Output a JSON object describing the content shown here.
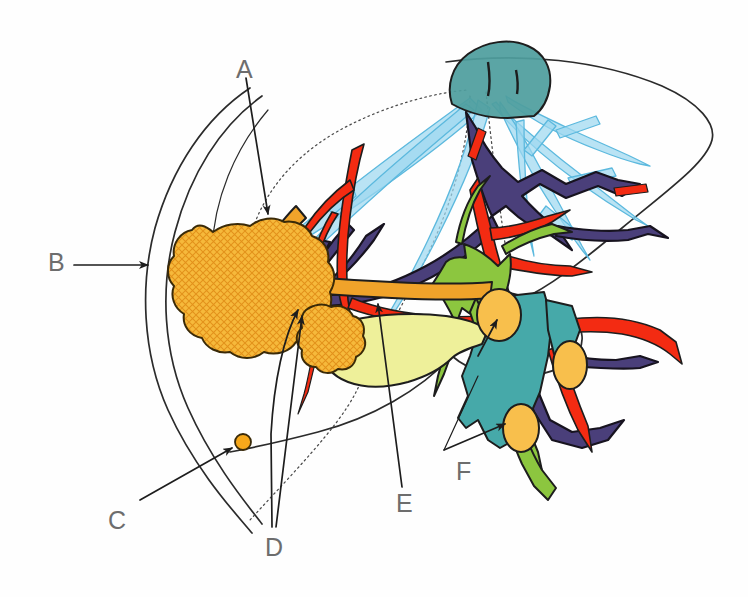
{
  "figure": {
    "background_color": "#ffffff",
    "width": 748,
    "height": 597
  },
  "palette": {
    "liver_outline": "#2b2b2b",
    "dotted_segment_line": "#555555",
    "hepatic_vein_blue": "#9ed8f0",
    "hepatic_vein_stroke": "#5bb8dd",
    "ivc_teal": "#4f9e9e",
    "duodenum_teal": "#46a9a9",
    "portal_vein_purple": "#4a3f7a",
    "hepatic_artery_red": "#f32b12",
    "bile_duct_green": "#8cc63f",
    "gallbladder_yellow": "#eef09a",
    "tumor_orange": "#f6b93b",
    "tumor_hatch": "#e8921c",
    "lymph_node_orange": "#f8bf4c",
    "label_gray": "#6d6d6d",
    "leader_line": "#2b2b2b"
  },
  "labels": [
    {
      "id": "A",
      "text": "A",
      "x": 236,
      "y": 57,
      "points_to": "cystic-duct-orange"
    },
    {
      "id": "B",
      "text": "B",
      "x": 48,
      "y": 250,
      "points_to": "large-tumor-mass"
    },
    {
      "id": "C",
      "text": "C",
      "x": 108,
      "y": 508,
      "points_to": "satellite-nodule"
    },
    {
      "id": "D",
      "text": "D",
      "x": 265,
      "y": 535,
      "points_to": "small-tumor-mass"
    },
    {
      "id": "E",
      "text": "E",
      "x": 396,
      "y": 495,
      "points_to": "common-bile-duct-orange"
    },
    {
      "id": "F",
      "text": "F",
      "x": 456,
      "y": 463,
      "points_to": "lymph-node-lower"
    }
  ],
  "structures": [
    {
      "name": "liver-outline",
      "label": "Liver capsule outline",
      "color": "#2b2b2b"
    },
    {
      "name": "inferior-vena-cava",
      "label": "Inferior vena cava",
      "color": "#4f9e9e"
    },
    {
      "name": "hepatic-veins",
      "label": "Hepatic veins",
      "color": "#9ed8f0"
    },
    {
      "name": "portal-vein-system",
      "label": "Portal vein branches",
      "color": "#4a3f7a"
    },
    {
      "name": "hepatic-artery-system",
      "label": "Hepatic artery branches",
      "color": "#f32b12"
    },
    {
      "name": "bile-duct-system",
      "label": "Intrahepatic bile ducts",
      "color": "#8cc63f"
    },
    {
      "name": "gallbladder",
      "label": "Gallbladder",
      "color": "#eef09a"
    },
    {
      "name": "large-tumor-mass",
      "label": "Large hatched tumor mass",
      "color": "#f6b93b"
    },
    {
      "name": "small-tumor-mass",
      "label": "Small hatched tumor mass",
      "color": "#f6b93b"
    },
    {
      "name": "satellite-nodule",
      "label": "Satellite nodule",
      "color": "#f6b93b"
    },
    {
      "name": "lymph-nodes",
      "label": "Lymph nodes",
      "color": "#f8bf4c"
    },
    {
      "name": "duodenum",
      "label": "Duodenum",
      "color": "#46a9a9"
    }
  ]
}
